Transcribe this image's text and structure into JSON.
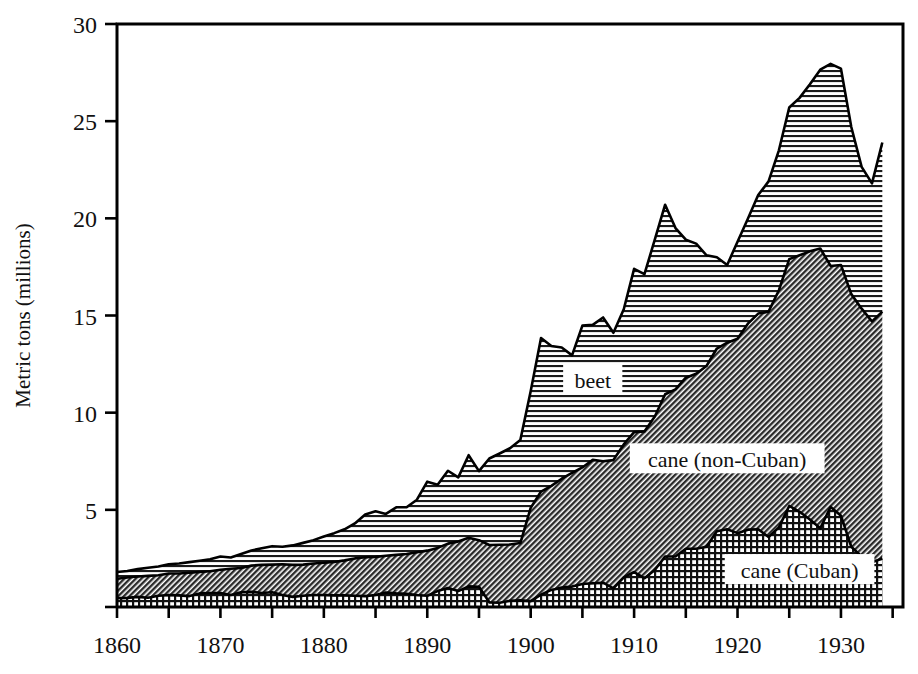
{
  "chart_data": {
    "type": "area",
    "stacked": true,
    "title": "",
    "xlabel": "",
    "ylabel": "Metric tons (millions)",
    "xlim": [
      1860,
      1936
    ],
    "ylim": [
      0,
      30
    ],
    "yticks": [
      0,
      5,
      10,
      15,
      20,
      25,
      30
    ],
    "ytick_labels": [
      "",
      "5",
      "10",
      "15",
      "20",
      "25",
      "30"
    ],
    "xticks": [
      1860,
      1865,
      1870,
      1875,
      1880,
      1885,
      1890,
      1895,
      1900,
      1905,
      1910,
      1915,
      1920,
      1925,
      1930,
      1935
    ],
    "xtick_labels": [
      "1860",
      "",
      "1870",
      "",
      "1880",
      "",
      "1890",
      "",
      "1900",
      "",
      "1910",
      "",
      "1920",
      "",
      "1930",
      ""
    ],
    "grid": false,
    "legend_position": "inline-annotations",
    "x": [
      1860,
      1861,
      1862,
      1863,
      1864,
      1865,
      1866,
      1867,
      1868,
      1869,
      1870,
      1871,
      1872,
      1873,
      1874,
      1875,
      1876,
      1877,
      1878,
      1879,
      1880,
      1881,
      1882,
      1883,
      1884,
      1885,
      1886,
      1887,
      1888,
      1889,
      1890,
      1891,
      1892,
      1893,
      1894,
      1895,
      1896,
      1897,
      1898,
      1899,
      1900,
      1901,
      1902,
      1903,
      1904,
      1905,
      1906,
      1907,
      1908,
      1909,
      1910,
      1911,
      1912,
      1913,
      1914,
      1915,
      1916,
      1917,
      1918,
      1919,
      1920,
      1921,
      1922,
      1923,
      1924,
      1925,
      1926,
      1927,
      1928,
      1929,
      1930,
      1931,
      1932,
      1933,
      1934
    ],
    "series": [
      {
        "name": "cane (Cuban)",
        "fill_pattern": "crosshatch-grid",
        "values": [
          0.45,
          0.47,
          0.52,
          0.48,
          0.58,
          0.62,
          0.6,
          0.56,
          0.7,
          0.72,
          0.72,
          0.62,
          0.76,
          0.78,
          0.72,
          0.76,
          0.62,
          0.52,
          0.58,
          0.62,
          0.62,
          0.6,
          0.6,
          0.58,
          0.56,
          0.62,
          0.74,
          0.7,
          0.68,
          0.62,
          0.58,
          0.82,
          0.98,
          0.82,
          1.06,
          1.04,
          0.24,
          0.22,
          0.32,
          0.34,
          0.3,
          0.64,
          0.88,
          1.0,
          1.05,
          1.18,
          1.22,
          1.25,
          0.96,
          1.52,
          1.8,
          1.48,
          1.9,
          2.6,
          2.6,
          3.0,
          3.0,
          3.1,
          3.9,
          4.0,
          3.8,
          3.98,
          4.0,
          3.6,
          4.1,
          5.2,
          4.9,
          4.5,
          4.05,
          5.15,
          4.7,
          3.1,
          2.6,
          2.3,
          2.5
        ]
      },
      {
        "name": "cane (non-Cuban)",
        "fill_pattern": "diagonal-hatch",
        "values": [
          1.0,
          1.05,
          1.05,
          1.12,
          1.05,
          1.1,
          1.12,
          1.2,
          1.1,
          1.12,
          1.2,
          1.35,
          1.25,
          1.35,
          1.45,
          1.42,
          1.58,
          1.65,
          1.6,
          1.62,
          1.66,
          1.72,
          1.8,
          1.92,
          2.0,
          1.96,
          1.9,
          1.98,
          2.05,
          2.2,
          2.32,
          2.22,
          2.28,
          2.55,
          2.5,
          2.4,
          2.95,
          2.98,
          2.9,
          2.95,
          4.8,
          5.3,
          5.35,
          5.6,
          5.85,
          6.0,
          6.35,
          6.25,
          6.6,
          6.85,
          7.2,
          7.55,
          7.9,
          8.35,
          8.6,
          8.8,
          9.0,
          9.3,
          9.4,
          9.6,
          10.0,
          10.6,
          11.1,
          11.6,
          12.2,
          12.7,
          13.2,
          13.8,
          14.4,
          12.4,
          12.9,
          13.0,
          12.75,
          12.4,
          12.7
        ]
      },
      {
        "name": "beet",
        "fill_pattern": "horizontal-hatch",
        "values": [
          0.35,
          0.33,
          0.38,
          0.42,
          0.45,
          0.48,
          0.52,
          0.55,
          0.58,
          0.62,
          0.68,
          0.58,
          0.72,
          0.78,
          0.85,
          0.95,
          0.9,
          1.0,
          1.12,
          1.2,
          1.35,
          1.48,
          1.6,
          1.8,
          2.2,
          2.35,
          2.15,
          2.45,
          2.4,
          2.7,
          3.55,
          3.25,
          3.75,
          3.3,
          4.25,
          3.55,
          4.45,
          4.7,
          4.95,
          5.3,
          6.0,
          7.9,
          7.2,
          6.75,
          6.05,
          7.3,
          6.95,
          7.4,
          6.55,
          6.95,
          8.4,
          8.1,
          9.1,
          9.75,
          8.3,
          7.1,
          6.7,
          5.7,
          4.7,
          4.0,
          5.0,
          5.4,
          6.1,
          6.7,
          7.2,
          7.8,
          8.1,
          8.6,
          9.2,
          10.4,
          10.1,
          8.6,
          7.3,
          7.1,
          8.7
        ]
      }
    ],
    "annotations": [
      {
        "text": "beet",
        "x": 1906,
        "y": 11.7
      },
      {
        "text": "cane (non-Cuban)",
        "x": 1919,
        "y": 7.6
      },
      {
        "text": "cane (Cuban)",
        "x": 1926,
        "y": 1.9
      }
    ]
  }
}
